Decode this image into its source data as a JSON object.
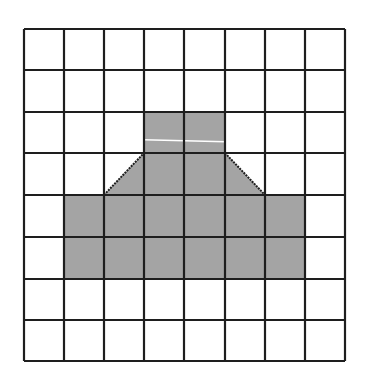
{
  "diagram": {
    "type": "grid-shape",
    "rows": 8,
    "columns": 8,
    "fill_color": "#a4a4a4",
    "line_color": "#1e1e1e",
    "background_color": "#ffffff",
    "highlight_line_color": "#ffffff",
    "shaded_cells": [
      {
        "row": 2,
        "col": 3,
        "shape": "full"
      },
      {
        "row": 2,
        "col": 4,
        "shape": "full"
      },
      {
        "row": 3,
        "col": 2,
        "shape": "triangle-lower-right"
      },
      {
        "row": 3,
        "col": 3,
        "shape": "full"
      },
      {
        "row": 3,
        "col": 4,
        "shape": "full"
      },
      {
        "row": 3,
        "col": 5,
        "shape": "triangle-lower-left"
      },
      {
        "row": 4,
        "col": 1,
        "shape": "full"
      },
      {
        "row": 4,
        "col": 2,
        "shape": "full"
      },
      {
        "row": 4,
        "col": 3,
        "shape": "full"
      },
      {
        "row": 4,
        "col": 4,
        "shape": "full"
      },
      {
        "row": 4,
        "col": 5,
        "shape": "full"
      },
      {
        "row": 4,
        "col": 6,
        "shape": "full"
      },
      {
        "row": 5,
        "col": 1,
        "shape": "full"
      },
      {
        "row": 5,
        "col": 2,
        "shape": "full"
      },
      {
        "row": 5,
        "col": 3,
        "shape": "full"
      },
      {
        "row": 5,
        "col": 4,
        "shape": "full"
      },
      {
        "row": 5,
        "col": 5,
        "shape": "full"
      },
      {
        "row": 5,
        "col": 6,
        "shape": "full"
      }
    ],
    "highlight_line": {
      "row": 2,
      "col_start": 3,
      "col_end": 4,
      "row_fraction": 0.7
    }
  }
}
